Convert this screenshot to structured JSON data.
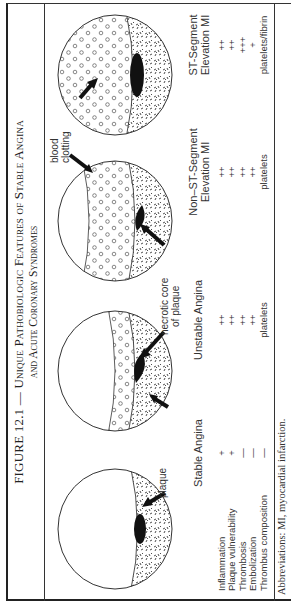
{
  "figure": {
    "title_line1_prefix": "FIGURE 12.1 — ",
    "title_line1_sc": "Unique Pathobiologic Features of Stable Angina",
    "title_line2_sc": "and Acute Coronary Syndromes",
    "footnote": "Abbreviations: MI, myocardial infarction."
  },
  "annotations": {
    "plaque": "plaque",
    "necrotic_core_1": "necrotic core",
    "necrotic_core_2": "of plaque",
    "blood_clotting_1": "blood",
    "blood_clotting_2": "clotting"
  },
  "table": {
    "row_labels": [
      "Inflammation",
      "Plaque vulnerability",
      "Thrombosis",
      "Embolization",
      "Thrombus composition"
    ],
    "columns": [
      {
        "heading_line1": "Stable Angina",
        "heading_line2": "",
        "values": [
          "+",
          "+",
          "—",
          "—",
          "—"
        ]
      },
      {
        "heading_line1": "Unstable Angina",
        "heading_line2": "",
        "values": [
          "++",
          "++",
          "++",
          "++",
          "platelets"
        ]
      },
      {
        "heading_line1": "Non–ST-Segment",
        "heading_line2": "Elevation MI",
        "values": [
          "++",
          "++",
          "++",
          "++",
          "platelets"
        ]
      },
      {
        "heading_line1": "ST-Segment",
        "heading_line2": "Elevation MI",
        "values": [
          "++",
          "++",
          "+++",
          "+",
          "platelets/fibrin"
        ]
      }
    ]
  }
}
